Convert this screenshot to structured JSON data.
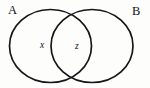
{
  "figure": {
    "type": "venn-diagram",
    "width": 150,
    "height": 88,
    "background_color": "#fdfdfc",
    "stroke_color": "#17161a",
    "text_color": "#111014"
  },
  "sets": [
    {
      "id": "A",
      "label": "A",
      "label_position": {
        "x": 8,
        "y": 4
      },
      "circle": {
        "cx": 50.5,
        "cy": 46,
        "rx": 41,
        "ry": 36.5
      }
    },
    {
      "id": "B",
      "label": "B",
      "label_position": {
        "x": 132,
        "y": 5
      },
      "circle": {
        "cx": 92,
        "cy": 46,
        "rx": 41,
        "ry": 36.5
      }
    }
  ],
  "regions": [
    {
      "id": "x",
      "label": "x",
      "meaning": "A only",
      "label_position": {
        "x": 40,
        "y": 41
      }
    },
    {
      "id": "z",
      "label": "z",
      "meaning": "A intersect B",
      "label_position": {
        "x": 75,
        "y": 41.5
      }
    }
  ]
}
